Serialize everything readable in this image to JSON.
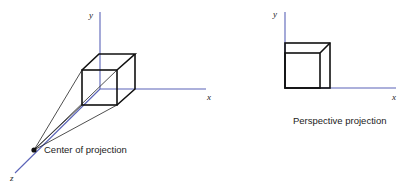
{
  "left_figure": {
    "axes": {
      "x_label": "x",
      "y_label": "y",
      "z_label": "z"
    },
    "center_label": "Center of projection"
  },
  "right_figure": {
    "axes": {
      "x_label": "x",
      "y_label": "y"
    },
    "caption": "Perspective projection"
  },
  "colors": {
    "axis": "#5a63b8",
    "edges": "#111111",
    "background": "#ffffff"
  }
}
